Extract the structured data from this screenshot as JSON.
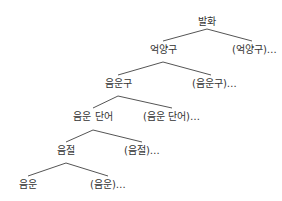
{
  "diagram": {
    "type": "prosodic-hierarchy-tree",
    "line_color": "#555555",
    "text_color": "#333333",
    "root": {
      "label": "발화"
    },
    "levels": [
      {
        "node": "억양구",
        "sibling": "(억양구)…"
      },
      {
        "node": "음운구",
        "sibling": "(음운구)…"
      },
      {
        "node": "음운 단어",
        "sibling": "(음운 단어)…"
      },
      {
        "node": "음절",
        "sibling": "(음절)…"
      },
      {
        "node": "음운",
        "sibling": "(음운)…"
      }
    ]
  }
}
